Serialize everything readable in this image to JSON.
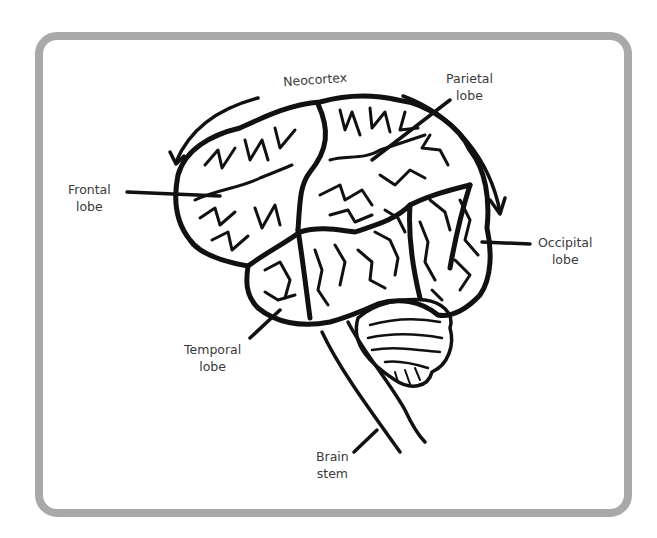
{
  "diagram": {
    "frame_color": "#a9a9a9",
    "line_color": "#111111",
    "text_color": "#3a3a3a",
    "labels": [
      {
        "id": "neocortex",
        "lines": [
          "Neocortex"
        ]
      },
      {
        "id": "parietal",
        "lines": [
          "Parietal",
          "lobe"
        ]
      },
      {
        "id": "frontal",
        "lines": [
          "Frontal",
          "lobe"
        ]
      },
      {
        "id": "occipital",
        "lines": [
          "Occipital",
          "lobe"
        ]
      },
      {
        "id": "temporal",
        "lines": [
          "Temporal",
          "lobe"
        ]
      },
      {
        "id": "brainstem",
        "lines": [
          "Brain",
          "stem"
        ]
      }
    ]
  }
}
